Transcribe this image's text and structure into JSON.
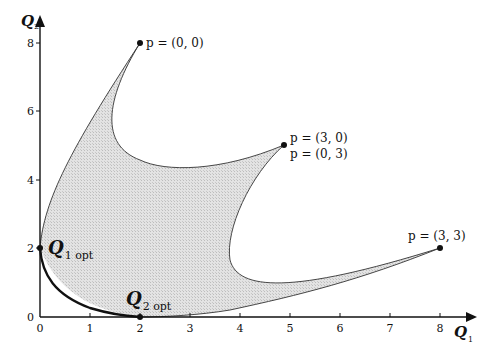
{
  "figure": {
    "type": "diagram",
    "colors": {
      "region_fill": "#d9d9d9",
      "axis": "#111111",
      "frontier": "#111111",
      "boundary": "#333333",
      "background": "#ffffff"
    }
  },
  "axes": {
    "x": {
      "label": "Q",
      "subscript": "1",
      "ticks": [
        "0",
        "1",
        "2",
        "3",
        "4",
        "5",
        "6",
        "7",
        "8"
      ],
      "range": [
        0,
        8.5
      ]
    },
    "y": {
      "label": "Q",
      "subscript": "2",
      "ticks": [
        "0",
        "2",
        "4",
        "6",
        "8"
      ],
      "range": [
        0,
        8.8
      ]
    }
  },
  "points": [
    {
      "id": "p00",
      "label": "p = (0, 0)",
      "q1": 2.0,
      "q2": 8.0
    },
    {
      "id": "p30",
      "label": "p = (3, 0)",
      "q1": 4.88,
      "q2": 5.0
    },
    {
      "id": "p03",
      "label": "p = (0, 3)",
      "q1": 4.88,
      "q2": 5.0
    },
    {
      "id": "p33",
      "label": "p = (3, 3)",
      "q1": 8.0,
      "q2": 2.0
    }
  ],
  "optima": {
    "q1_opt": {
      "label": "Q",
      "subscript": "1 opt",
      "q1": 0,
      "q2": 2.0
    },
    "q2_opt": {
      "label": "Q",
      "subscript": "2 opt",
      "q1": 2.0,
      "q2": 0
    }
  }
}
